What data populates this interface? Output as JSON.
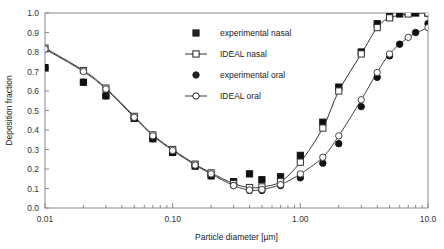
{
  "chart_data": {
    "type": "line",
    "title": "",
    "xlabel": "Particle diameter [µm]",
    "ylabel": "Deposition fraction",
    "xscale": "log",
    "xlim": [
      0.01,
      10.0
    ],
    "ylim": [
      0.0,
      1.0
    ],
    "grid": false,
    "legend_position": "upper-center-left",
    "xticks": [
      "0.01",
      "0.10",
      "1.00",
      "10.0"
    ],
    "xtick_values": [
      0.01,
      0.1,
      1.0,
      10.0
    ],
    "yticks": [
      "0.0",
      "0.1",
      "0.2",
      "0.3",
      "0.4",
      "0.5",
      "0.6",
      "0.7",
      "0.8",
      "0.9",
      "1.0"
    ],
    "ytick_values": [
      0.0,
      0.1,
      0.2,
      0.3,
      0.4,
      0.5,
      0.6,
      0.7,
      0.8,
      0.9,
      1.0
    ],
    "series": [
      {
        "name": "experimental nasal",
        "marker": "filled-square",
        "line": false,
        "color": "#111111",
        "x": [
          0.01,
          0.02,
          0.03,
          0.05,
          0.07,
          0.1,
          0.15,
          0.2,
          0.3,
          0.4,
          0.5,
          0.7,
          1.0,
          1.5,
          2.0,
          3.0,
          4.0,
          5.0,
          6.0,
          7.0,
          8.0,
          10.0
        ],
        "y": [
          0.72,
          0.645,
          0.575,
          0.46,
          0.355,
          0.285,
          0.215,
          0.165,
          0.135,
          0.175,
          0.145,
          0.16,
          0.27,
          0.44,
          0.62,
          0.8,
          0.945,
          0.985,
          0.995,
          1.0,
          1.0,
          1.0
        ]
      },
      {
        "name": "IDEAL nasal",
        "marker": "open-square",
        "line": true,
        "color": "#333333",
        "x": [
          0.01,
          0.02,
          0.03,
          0.05,
          0.07,
          0.1,
          0.15,
          0.2,
          0.3,
          0.4,
          0.5,
          0.7,
          1.0,
          1.5,
          2.0,
          3.0,
          4.0,
          5.0,
          7.0,
          10.0
        ],
        "y": [
          0.82,
          0.705,
          0.615,
          0.47,
          0.375,
          0.3,
          0.225,
          0.18,
          0.125,
          0.105,
          0.108,
          0.135,
          0.235,
          0.41,
          0.6,
          0.79,
          0.925,
          0.975,
          0.995,
          1.0
        ]
      },
      {
        "name": "experimental oral",
        "marker": "filled-circle",
        "line": false,
        "color": "#111111",
        "x": [
          0.01,
          0.02,
          0.03,
          0.05,
          0.07,
          0.1,
          0.15,
          0.2,
          0.3,
          0.4,
          0.5,
          0.7,
          1.0,
          1.5,
          2.0,
          3.0,
          4.0,
          5.0,
          6.0,
          8.0,
          10.0
        ],
        "y": [
          0.72,
          0.645,
          0.575,
          0.46,
          0.355,
          0.285,
          0.215,
          0.165,
          0.115,
          0.09,
          0.09,
          0.115,
          0.155,
          0.23,
          0.33,
          0.52,
          0.67,
          0.78,
          0.84,
          0.9,
          0.945
        ]
      },
      {
        "name": "IDEAL oral",
        "marker": "open-circle",
        "line": true,
        "color": "#444444",
        "x": [
          0.01,
          0.02,
          0.03,
          0.05,
          0.07,
          0.1,
          0.15,
          0.2,
          0.3,
          0.4,
          0.5,
          0.7,
          1.0,
          1.5,
          2.0,
          3.0,
          4.0,
          5.0,
          7.0,
          10.0
        ],
        "y": [
          0.815,
          0.7,
          0.61,
          0.465,
          0.37,
          0.295,
          0.22,
          0.175,
          0.115,
          0.092,
          0.095,
          0.12,
          0.175,
          0.26,
          0.37,
          0.555,
          0.695,
          0.79,
          0.875,
          0.925
        ]
      }
    ]
  },
  "legend": {
    "items": [
      {
        "label": "experimental nasal",
        "marker": "filled-square",
        "with_line": false
      },
      {
        "label": "IDEAL nasal",
        "marker": "open-square",
        "with_line": true
      },
      {
        "label": "experimental oral",
        "marker": "filled-circle",
        "with_line": false
      },
      {
        "label": "IDEAL oral",
        "marker": "open-circle",
        "with_line": true
      }
    ]
  }
}
